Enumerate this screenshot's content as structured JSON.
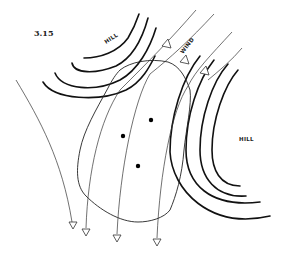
{
  "figure": {
    "number": "3.15",
    "labels": {
      "hill_left": "HILL",
      "hill_right": "HILL",
      "wind": "WIND"
    },
    "elements": {
      "hill_left_contours": 4,
      "hill_right_contours": 4,
      "wind_flow_lines": 5,
      "observation_points": 3
    }
  }
}
